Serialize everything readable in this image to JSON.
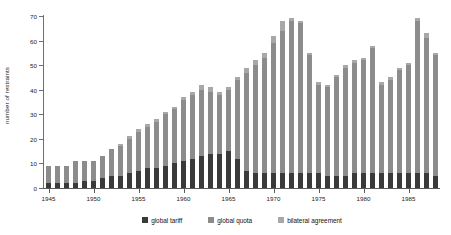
{
  "chart_data": {
    "type": "bar",
    "stacked": true,
    "title": "",
    "subtitle": "",
    "xlabel": "",
    "ylabel": "number of restraints",
    "ylim": [
      0,
      70
    ],
    "ytick_values": [
      0,
      10,
      20,
      30,
      40,
      50,
      60,
      70
    ],
    "ytick_labels": [
      "0",
      "10",
      "20",
      "30",
      "40",
      "50",
      "60",
      "70"
    ],
    "grid": false,
    "legend_position": "bottom",
    "x_axis_type": "year",
    "xtick_labels": [
      "1945",
      "1950",
      "1955",
      "1960",
      "1965",
      "1970",
      "1975",
      "1980",
      "1985"
    ],
    "xtick_values": [
      1945,
      1950,
      1955,
      1960,
      1965,
      1970,
      1975,
      1980,
      1985
    ],
    "x": [
      1945,
      1946,
      1947,
      1948,
      1949,
      1950,
      1951,
      1952,
      1953,
      1954,
      1955,
      1956,
      1957,
      1958,
      1959,
      1960,
      1961,
      1962,
      1963,
      1964,
      1965,
      1966,
      1967,
      1968,
      1969,
      1970,
      1971,
      1972,
      1973,
      1974,
      1975,
      1976,
      1977,
      1978,
      1979,
      1980,
      1981,
      1982,
      1983,
      1984,
      1985,
      1986,
      1987,
      1988
    ],
    "categories": [
      "1945",
      "1946",
      "1947",
      "1948",
      "1949",
      "1950",
      "1951",
      "1952",
      "1953",
      "1954",
      "1955",
      "1956",
      "1957",
      "1958",
      "1959",
      "1960",
      "1961",
      "1962",
      "1963",
      "1964",
      "1965",
      "1966",
      "1967",
      "1968",
      "1969",
      "1970",
      "1971",
      "1972",
      "1973",
      "1974",
      "1975",
      "1976",
      "1977",
      "1978",
      "1979",
      "1980",
      "1981",
      "1982",
      "1983",
      "1984",
      "1985",
      "1986",
      "1987",
      "1988"
    ],
    "series": [
      {
        "name": "global tariff",
        "color": "#3a3a3a",
        "values": [
          2,
          2,
          2,
          2,
          3,
          3,
          4,
          5,
          5,
          6,
          7,
          8,
          8,
          9,
          10,
          11,
          12,
          13,
          14,
          14,
          15,
          12,
          7,
          6,
          6,
          6,
          6,
          6,
          6,
          6,
          6,
          5,
          5,
          5,
          6,
          6,
          6,
          6,
          6,
          6,
          6,
          6,
          6,
          5
        ]
      },
      {
        "name": "global quota",
        "color": "#8c8c8c",
        "values": [
          7,
          7,
          7,
          9,
          8,
          8,
          9,
          11,
          12,
          14,
          16,
          17,
          19,
          21,
          22,
          25,
          26,
          27,
          25,
          24,
          25,
          32,
          40,
          44,
          47,
          53,
          58,
          62,
          61,
          48,
          36,
          36,
          40,
          44,
          45,
          46,
          51,
          36,
          38,
          42,
          44,
          62,
          55,
          49
        ]
      },
      {
        "name": "bilateral agreement",
        "color": "#a8a8a8",
        "values": [
          0,
          0,
          0,
          0,
          0,
          0,
          0,
          0,
          1,
          1,
          1,
          1,
          1,
          1,
          1,
          1,
          1,
          2,
          2,
          1,
          1,
          1,
          2,
          2,
          2,
          3,
          4,
          1,
          1,
          1,
          1,
          1,
          1,
          1,
          1,
          1,
          1,
          1,
          1,
          1,
          1,
          1,
          2,
          1
        ]
      }
    ],
    "totals": [
      9,
      9,
      9,
      11,
      11,
      11,
      13,
      16,
      18,
      21,
      24,
      26,
      28,
      31,
      33,
      37,
      39,
      42,
      41,
      39,
      41,
      45,
      49,
      52,
      55,
      62,
      68,
      69,
      68,
      60,
      48,
      42,
      46,
      50,
      52,
      53,
      58,
      43,
      45,
      49,
      51,
      69,
      63,
      55
    ]
  },
  "legend": {
    "items": [
      {
        "label": "global tariff",
        "color": "#3a3a3a"
      },
      {
        "label": "global quota",
        "color": "#8c8c8c"
      },
      {
        "label": "bilateral agreement",
        "color": "#a8a8a8"
      }
    ]
  }
}
